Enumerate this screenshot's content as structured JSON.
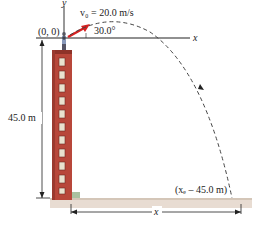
{
  "figure": {
    "origin_label": "(0, 0)",
    "y_axis_label": "y",
    "x_axis_label": "x",
    "velocity_label": "v₀ = 20.0 m/s",
    "angle_label": "30.0°",
    "height_label": "45.0 m",
    "landing_label": "(xₑ – 45.0 m)",
    "distance_label": "x",
    "colors": {
      "building": "#b8473a",
      "building_dark": "#8e3329",
      "window": "#e9e2cf",
      "ground": "#e8dcd2",
      "arrow": "#d62020",
      "trajectory": "#444444"
    },
    "building_floors": 11
  }
}
